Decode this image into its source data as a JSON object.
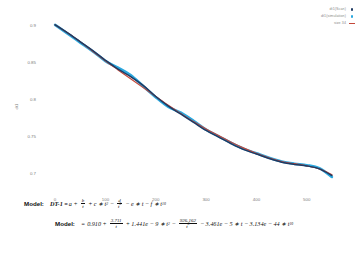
{
  "chart_data": {
    "type": "line",
    "title": "",
    "xlabel": "",
    "ylabel": "dt1",
    "xlim": [
      -30,
      570
    ],
    "ylim": [
      0.675,
      0.912
    ],
    "grid": false,
    "legend_position": "top-right",
    "xticks": [
      "0",
      "100",
      "200",
      "300",
      "400",
      "500"
    ],
    "xtick_values": [
      0,
      100,
      200,
      300,
      400,
      500
    ],
    "yticks": [
      "0.9",
      "0.85",
      "0.8",
      "0.75",
      "0.7"
    ],
    "ytick_values": [
      0.9,
      0.85,
      0.8,
      0.75,
      0.7
    ],
    "x": [
      0,
      25,
      50,
      75,
      100,
      125,
      150,
      175,
      200,
      225,
      250,
      275,
      300,
      325,
      350,
      375,
      400,
      425,
      450,
      475,
      500,
      525,
      550
    ],
    "series": [
      {
        "name": "dt1(Scan)",
        "color": "#1f3b63",
        "marker": "dot",
        "values": [
          0.9,
          0.889,
          0.877,
          0.865,
          0.852,
          0.84,
          0.83,
          0.818,
          0.803,
          0.79,
          0.779,
          0.768,
          0.757,
          0.748,
          0.739,
          0.731,
          0.725,
          0.719,
          0.714,
          0.711,
          0.709,
          0.705,
          0.696
        ]
      },
      {
        "name": "dt1(simulation)",
        "color": "#2aa8df",
        "marker": "dot",
        "values": [
          0.9,
          0.888,
          0.876,
          0.864,
          0.851,
          0.842,
          0.832,
          0.817,
          0.802,
          0.789,
          0.781,
          0.77,
          0.758,
          0.749,
          0.74,
          0.732,
          0.726,
          0.72,
          0.715,
          0.712,
          0.71,
          0.706,
          0.694
        ]
      },
      {
        "name": "size 34",
        "color": "#c4483a",
        "marker": "line",
        "values": [
          0.9,
          0.889,
          0.877,
          0.864,
          0.851,
          0.839,
          0.827,
          0.815,
          0.803,
          0.791,
          0.78,
          0.769,
          0.759,
          0.75,
          0.741,
          0.733,
          0.726,
          0.72,
          0.715,
          0.712,
          0.709,
          0.705,
          0.697
        ]
      }
    ]
  },
  "legend": {
    "entries": [
      {
        "label": "dt1(Scan)",
        "color": "#1f3b63",
        "marker": "dot"
      },
      {
        "label": "dt1(simulation)",
        "color": "#2aa8df",
        "marker": "dot"
      },
      {
        "label": "size 34",
        "color": "#c4483a",
        "marker": "line"
      }
    ]
  },
  "models": {
    "keyword_1": "Model:",
    "keyword_2": "Model:",
    "equation_1": {
      "lhs": "DT-1 =",
      "t1": "a",
      "op1": "+",
      "frac1_num": "b",
      "frac1_den": "t",
      "op2": "+",
      "t2": "c",
      "dot2": "∗",
      "t2b": "t",
      "t2exp": "2",
      "op3": "−",
      "frac2_num": "d",
      "frac2_den": "t",
      "frac2_den_exp": "3",
      "op4": "−",
      "t3": "e",
      "dot3": "∗",
      "t3b": "t",
      "op5": "−",
      "t4": "f",
      "dot4": "∗",
      "t4b": "t",
      "t4exp": "10"
    },
    "equation_2": {
      "lhs": "=",
      "t1": "0.910",
      "op1": "+",
      "frac1_num": "3.711",
      "frac1_den": "t",
      "op2": "+",
      "t2": "1.441e − 9",
      "dot2": "∗",
      "t2b": "t",
      "t2exp": "2",
      "op3": "−",
      "frac2_num": "926.162",
      "frac2_den": "t",
      "frac2_den_exp": "3",
      "op4": "−",
      "t3": "3.461e − 5",
      "dot3": "∗",
      "t3b": "t",
      "op5": "−",
      "t4": "3.134e − 44",
      "dot4": "∗",
      "t4b": "t",
      "t4exp": "10"
    }
  }
}
